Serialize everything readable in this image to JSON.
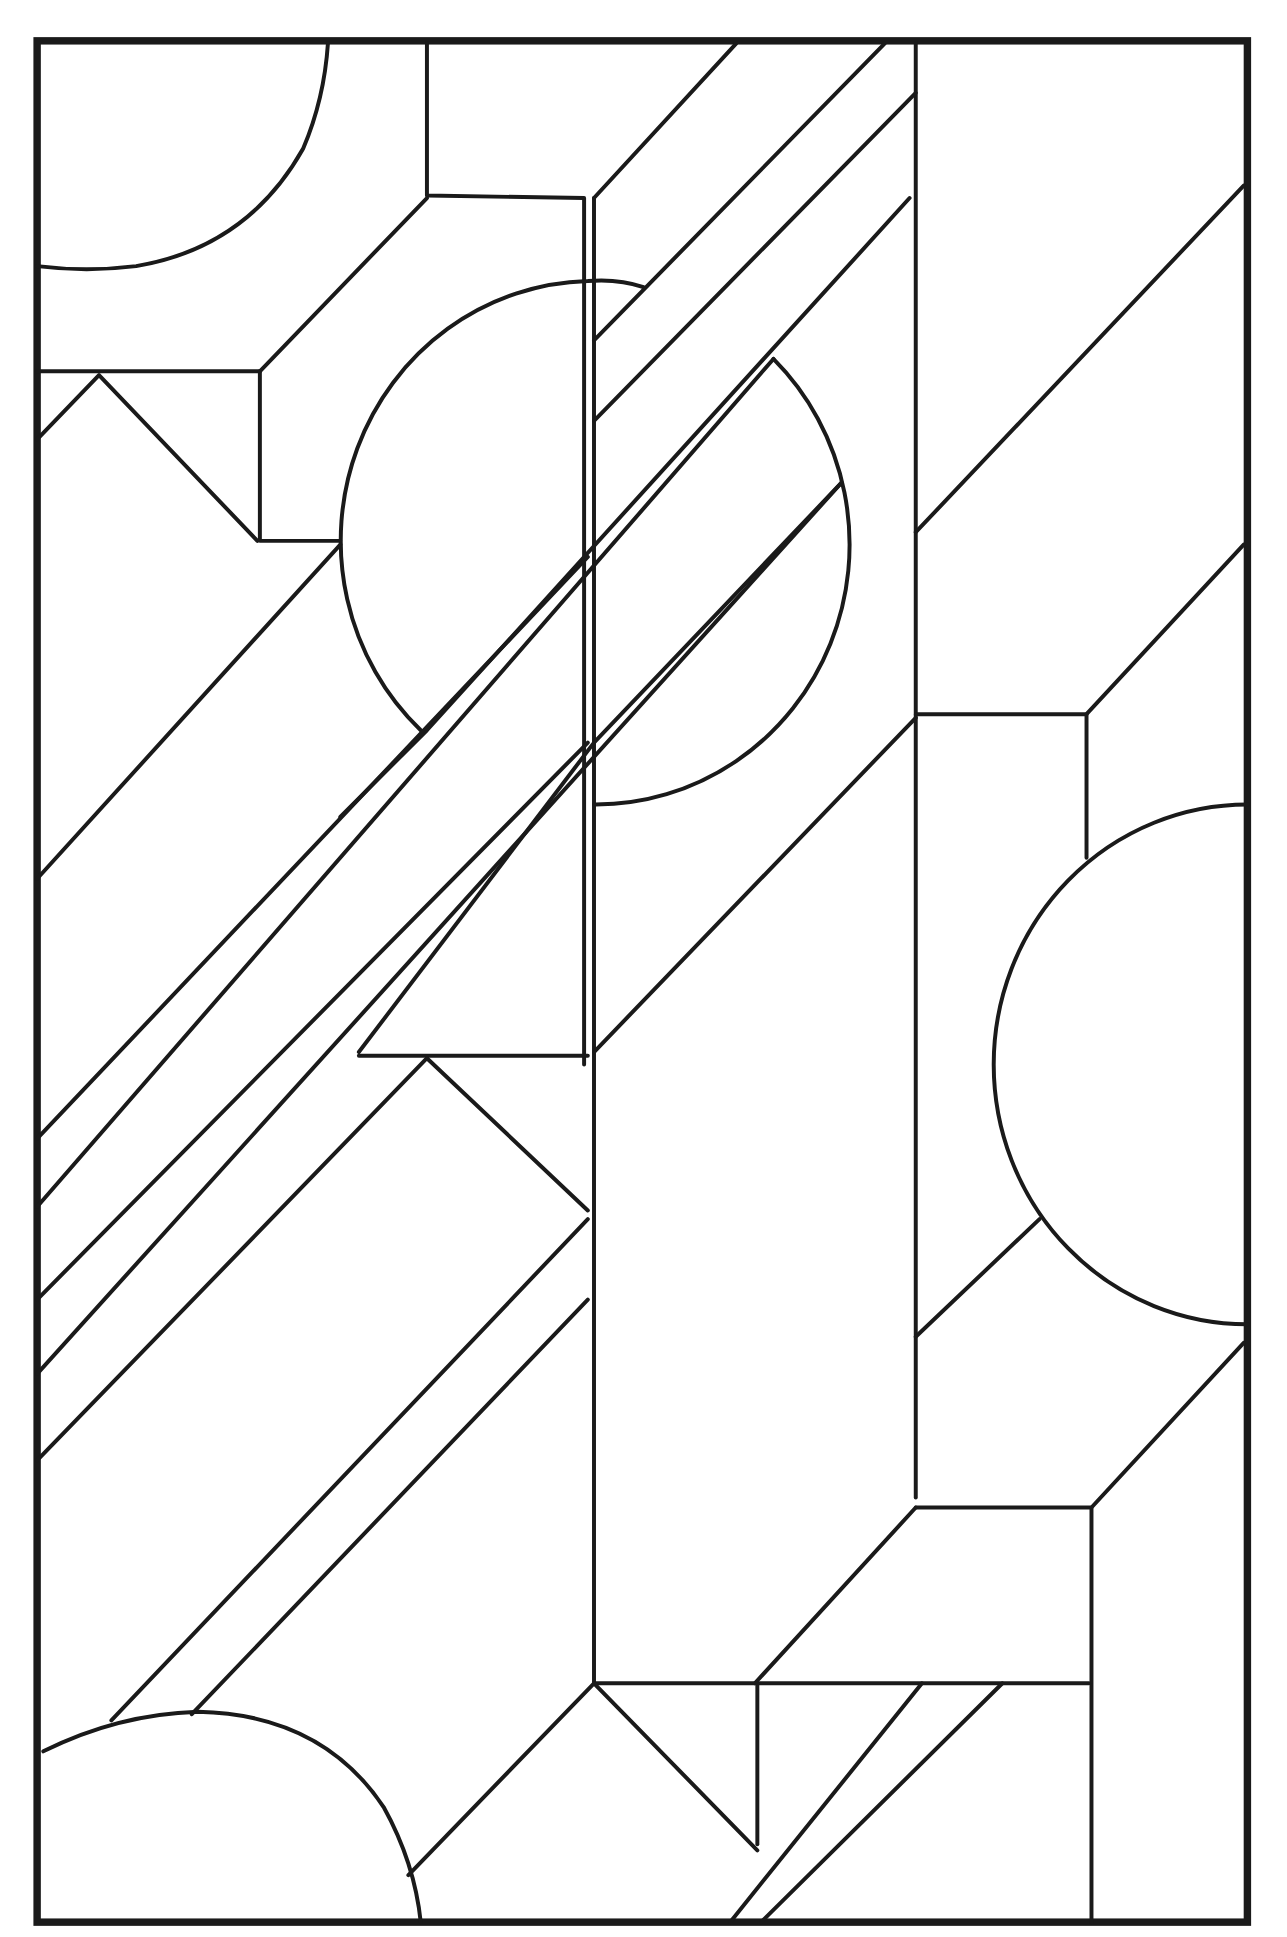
{
  "artwork": {
    "title": "Geometric stained-glass pattern (line art)",
    "style": "black lead lines on white",
    "stroke_color": "#1a1a1a",
    "background_color": "#ffffff",
    "motifs": [
      "diagonal bands",
      "circles",
      "quarter circles",
      "semicircles",
      "chevrons",
      "rectangular panes"
    ]
  }
}
